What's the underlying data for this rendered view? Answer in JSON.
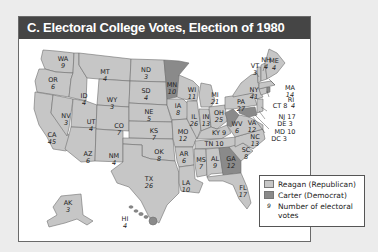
{
  "title": "C. Electoral College Votes, Election of 1980",
  "colors": {
    "reagan": "#c6c6c6",
    "carter": "#8a8a8a",
    "title_bg": "#454545",
    "border": "#6a6a6a"
  },
  "legend": {
    "reagan_label": "Reagan (Republican)",
    "carter_label": "Carter (Democrat)",
    "number_symbol": "9",
    "number_label_line1": "Number of electoral",
    "number_label_line2": "votes"
  },
  "states": [
    {
      "abbr": "WA",
      "votes": "9",
      "winner": "Reagan"
    },
    {
      "abbr": "OR",
      "votes": "6",
      "winner": "Reagan"
    },
    {
      "abbr": "CA",
      "votes": "45",
      "winner": "Reagan"
    },
    {
      "abbr": "NV",
      "votes": "3",
      "winner": "Reagan"
    },
    {
      "abbr": "ID",
      "votes": "4",
      "winner": "Reagan"
    },
    {
      "abbr": "MT",
      "votes": "4",
      "winner": "Reagan"
    },
    {
      "abbr": "WY",
      "votes": "3",
      "winner": "Reagan"
    },
    {
      "abbr": "UT",
      "votes": "4",
      "winner": "Reagan"
    },
    {
      "abbr": "CO",
      "votes": "7",
      "winner": "Reagan"
    },
    {
      "abbr": "AZ",
      "votes": "6",
      "winner": "Reagan"
    },
    {
      "abbr": "NM",
      "votes": "4",
      "winner": "Reagan"
    },
    {
      "abbr": "ND",
      "votes": "3",
      "winner": "Reagan"
    },
    {
      "abbr": "SD",
      "votes": "4",
      "winner": "Reagan"
    },
    {
      "abbr": "NE",
      "votes": "5",
      "winner": "Reagan"
    },
    {
      "abbr": "KS",
      "votes": "7",
      "winner": "Reagan"
    },
    {
      "abbr": "OK",
      "votes": "8",
      "winner": "Reagan"
    },
    {
      "abbr": "TX",
      "votes": "26",
      "winner": "Reagan"
    },
    {
      "abbr": "MN",
      "votes": "10",
      "winner": "Carter"
    },
    {
      "abbr": "IA",
      "votes": "8",
      "winner": "Reagan"
    },
    {
      "abbr": "MO",
      "votes": "12",
      "winner": "Reagan"
    },
    {
      "abbr": "AR",
      "votes": "6",
      "winner": "Reagan"
    },
    {
      "abbr": "LA",
      "votes": "10",
      "winner": "Reagan"
    },
    {
      "abbr": "WI",
      "votes": "11",
      "winner": "Reagan"
    },
    {
      "abbr": "IL",
      "votes": "26",
      "winner": "Reagan"
    },
    {
      "abbr": "MI",
      "votes": "21",
      "winner": "Reagan"
    },
    {
      "abbr": "IN",
      "votes": "13",
      "winner": "Reagan"
    },
    {
      "abbr": "OH",
      "votes": "25",
      "winner": "Reagan"
    },
    {
      "abbr": "KY",
      "votes": "9",
      "winner": "Reagan"
    },
    {
      "abbr": "TN",
      "votes": "10",
      "winner": "Reagan"
    },
    {
      "abbr": "MS",
      "votes": "7",
      "winner": "Reagan"
    },
    {
      "abbr": "AL",
      "votes": "9",
      "winner": "Reagan"
    },
    {
      "abbr": "GA",
      "votes": "12",
      "winner": "Carter"
    },
    {
      "abbr": "FL",
      "votes": "17",
      "winner": "Reagan"
    },
    {
      "abbr": "SC",
      "votes": "8",
      "winner": "Reagan"
    },
    {
      "abbr": "NC",
      "votes": "13",
      "winner": "Reagan"
    },
    {
      "abbr": "VA",
      "votes": "12",
      "winner": "Reagan"
    },
    {
      "abbr": "WV",
      "votes": "6",
      "winner": "Carter"
    },
    {
      "abbr": "PA",
      "votes": "27",
      "winner": "Reagan"
    },
    {
      "abbr": "NY",
      "votes": "41",
      "winner": "Reagan"
    },
    {
      "abbr": "VT",
      "votes": "3",
      "winner": "Reagan"
    },
    {
      "abbr": "NH",
      "votes": "4",
      "winner": "Reagan"
    },
    {
      "abbr": "ME",
      "votes": "4",
      "winner": "Reagan"
    },
    {
      "abbr": "MA",
      "votes": "14",
      "winner": "Reagan"
    },
    {
      "abbr": "RI",
      "votes": "4",
      "winner": "Carter"
    },
    {
      "abbr": "CT",
      "votes": "8",
      "winner": "Reagan"
    },
    {
      "abbr": "NJ",
      "votes": "17",
      "winner": "Reagan"
    },
    {
      "abbr": "DE",
      "votes": "3",
      "winner": "Reagan"
    },
    {
      "abbr": "MD",
      "votes": "10",
      "winner": "Carter"
    },
    {
      "abbr": "DC",
      "votes": "3",
      "winner": "Carter"
    },
    {
      "abbr": "AK",
      "votes": "3",
      "winner": "Reagan"
    },
    {
      "abbr": "HI",
      "votes": "4",
      "winner": "Carter"
    }
  ]
}
